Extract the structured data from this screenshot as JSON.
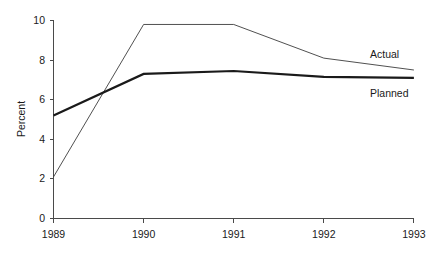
{
  "chart_data": {
    "type": "line",
    "title": "",
    "xlabel": "",
    "ylabel": "Percent",
    "categories": [
      "1989",
      "1990",
      "1991",
      "1992",
      "1993"
    ],
    "x": [
      1989,
      1990,
      1991,
      1992,
      1993
    ],
    "series": [
      {
        "name": "Actual",
        "values": [
          2.1,
          9.8,
          9.8,
          8.1,
          7.5
        ],
        "style": "thin",
        "color": "#3c3c3c"
      },
      {
        "name": "Planned",
        "values": [
          5.2,
          7.3,
          7.45,
          7.15,
          7.1
        ],
        "style": "thick",
        "color": "#1a1a1a"
      }
    ],
    "ylim": [
      0,
      10
    ],
    "yticks": [
      0,
      2,
      4,
      6,
      8,
      10
    ],
    "ytick_labels": [
      "0",
      "2",
      "4",
      "6",
      "8",
      "10"
    ],
    "xtick_labels": [
      "1989",
      "1990",
      "1991",
      "1992",
      "1993"
    ],
    "grid": false,
    "legend": "inline-right-end-labels",
    "background": "#ffffff",
    "axis_color": "#4a4a4a"
  },
  "axis": {
    "y_title": "Percent"
  },
  "labels": {
    "series_actual": "Actual",
    "series_planned": "Planned"
  }
}
